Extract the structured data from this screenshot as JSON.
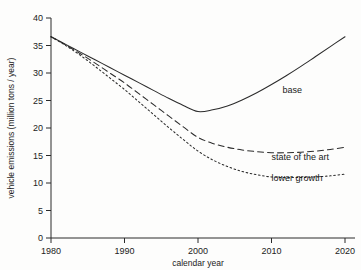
{
  "chart_data": {
    "type": "line",
    "title": "",
    "xlabel": "calendar year",
    "ylabel": "vehicle emissions (million tons / year)",
    "xlim": [
      1980,
      2020
    ],
    "ylim": [
      0,
      40
    ],
    "xticks": [
      1980,
      1990,
      2000,
      2010,
      2020
    ],
    "xticklabels": [
      "1980",
      "1990",
      "2000",
      "2010",
      "2020"
    ],
    "yticks": [
      0,
      5,
      10,
      15,
      20,
      25,
      30,
      35,
      40
    ],
    "yticklabels": [
      "0",
      "5",
      "10",
      "15",
      "20",
      "25",
      "30",
      "35",
      "40"
    ],
    "grid": false,
    "legend_position": "inline-annotations",
    "x": [
      1980,
      1982,
      1984,
      1986,
      1988,
      1990,
      1992,
      1994,
      1996,
      1998,
      2000,
      2002,
      2004,
      2006,
      2008,
      2010,
      2012,
      2014,
      2016,
      2018,
      2020
    ],
    "series": [
      {
        "name": "base",
        "style": "solid",
        "annotation": "base",
        "annotation_x": 2011.5,
        "annotation_y": 26.3,
        "values": [
          36.6,
          35.2,
          33.8,
          32.4,
          31.0,
          29.6,
          28.2,
          26.8,
          25.4,
          24.1,
          23.0,
          23.3,
          24.0,
          25.1,
          26.4,
          27.9,
          29.5,
          31.2,
          33.0,
          34.8,
          36.6
        ]
      },
      {
        "name": "state of the art",
        "style": "dashed",
        "annotation": "state of the art",
        "annotation_x": 2010.0,
        "annotation_y": 14.2,
        "values": [
          36.6,
          35.1,
          33.5,
          31.8,
          30.0,
          28.2,
          26.2,
          24.2,
          22.2,
          20.2,
          18.3,
          17.2,
          16.5,
          16.0,
          15.7,
          15.5,
          15.5,
          15.6,
          15.8,
          16.1,
          16.5
        ]
      },
      {
        "name": "lower growth",
        "style": "dotted",
        "annotation": "lower growth",
        "annotation_x": 2010.0,
        "annotation_y": 10.3,
        "values": [
          36.6,
          35.0,
          33.2,
          31.2,
          29.1,
          27.0,
          24.7,
          22.4,
          20.1,
          17.9,
          15.8,
          14.2,
          13.0,
          12.1,
          11.5,
          11.1,
          11.0,
          11.0,
          11.1,
          11.3,
          11.6
        ]
      }
    ]
  },
  "axes": {
    "xlabel": "calendar year",
    "ylabel": "vehicle emissions (million tons / year)"
  }
}
